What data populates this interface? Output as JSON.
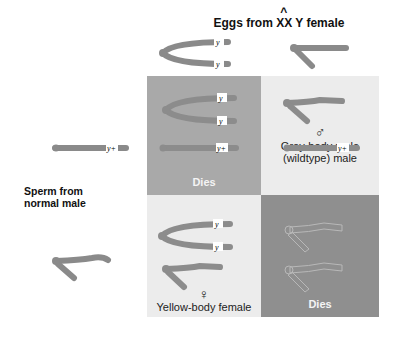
{
  "title": {
    "prefix": "Eggs from ",
    "attached": "XX",
    "suffix": " Y female"
  },
  "row_header": {
    "line1": "Sperm from",
    "line2": "normal male"
  },
  "chromosome_tags": {
    "y_mutant": "y",
    "y_wildtype": "y+"
  },
  "gametes": {
    "eggs": [
      "attached-X (y/y)",
      "Y"
    ],
    "sperm": [
      "X (y+)",
      "Y"
    ]
  },
  "cells": [
    {
      "position": "top-left",
      "outcome": "Dies",
      "genotype": "XX(y,y) / X(y+)",
      "shade": "#a9a9a9"
    },
    {
      "position": "top-right",
      "symbol": "♂",
      "outcome_line1": "Grey-body male",
      "outcome_line2": "(wildtype) male",
      "genotype": "Y / X(y+)",
      "shade": "#ececec"
    },
    {
      "position": "bottom-left",
      "symbol": "♀",
      "outcome": "Yellow-body female",
      "genotype": "XX(y,y) / Y",
      "shade": "#ececec"
    },
    {
      "position": "bottom-right",
      "outcome": "Dies",
      "genotype": "Y / Y",
      "shade": "#8f8f8f"
    }
  ],
  "colors": {
    "chromosome": "#8a8a8a",
    "dies_light": "#a9a9a9",
    "dies_dark": "#8f8f8f",
    "viable": "#ececec"
  }
}
